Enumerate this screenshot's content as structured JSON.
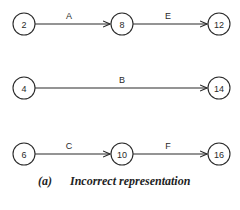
{
  "diagram": {
    "caption_prefix": "(a)",
    "caption_text": "Incorrect representation",
    "nodes": [
      {
        "id": "2",
        "label": "2",
        "x": 24,
        "y": 24
      },
      {
        "id": "8",
        "label": "8",
        "x": 122,
        "y": 24
      },
      {
        "id": "12",
        "label": "12",
        "x": 219,
        "y": 24
      },
      {
        "id": "4",
        "label": "4",
        "x": 24,
        "y": 88
      },
      {
        "id": "14",
        "label": "14",
        "x": 219,
        "y": 88
      },
      {
        "id": "6",
        "label": "6",
        "x": 24,
        "y": 154
      },
      {
        "id": "10",
        "label": "10",
        "x": 122,
        "y": 154
      },
      {
        "id": "16",
        "label": "16",
        "x": 219,
        "y": 154
      }
    ],
    "edges": [
      {
        "from": "2",
        "to": "8",
        "label": "A"
      },
      {
        "from": "8",
        "to": "12",
        "label": "E"
      },
      {
        "from": "4",
        "to": "14",
        "label": "B"
      },
      {
        "from": "6",
        "to": "10",
        "label": "C"
      },
      {
        "from": "10",
        "to": "16",
        "label": "F"
      }
    ]
  }
}
